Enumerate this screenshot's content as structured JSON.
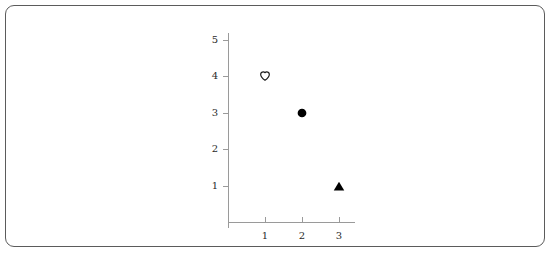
{
  "chart_data": {
    "type": "scatter",
    "title": "",
    "subtitle": "",
    "xlabel": "",
    "ylabel": "",
    "xlim": [
      0,
      3.6
    ],
    "ylim": [
      0,
      5
    ],
    "grid": false,
    "legend": false,
    "x_ticks": [
      "1",
      "2",
      "3"
    ],
    "y_ticks": [
      "1",
      "2",
      "3",
      "4",
      "5"
    ],
    "x_tick_values": [
      1,
      2,
      3
    ],
    "y_tick_values": [
      1,
      2,
      3,
      4,
      5
    ],
    "points": [
      {
        "x": 1,
        "y": 4,
        "marker": "heart-open",
        "filled": false,
        "color": "#1a1a1a"
      },
      {
        "x": 2,
        "y": 3,
        "marker": "circle-filled",
        "filled": true,
        "color": "#000000"
      },
      {
        "x": 3,
        "y": 1,
        "marker": "triangle-up-filled",
        "filled": true,
        "color": "#000000"
      }
    ],
    "series": [
      {
        "name": "",
        "x": [
          1,
          2,
          3
        ],
        "y": [
          4,
          3,
          1
        ],
        "markers": [
          "heart-open",
          "circle-filled",
          "triangle-up-filled"
        ]
      }
    ],
    "colors": {
      "axis": "#9a9a9a",
      "frame": "#5b5b5b",
      "marker": "#000000",
      "text": "#2a2a2a",
      "background": "#ffffff"
    }
  }
}
